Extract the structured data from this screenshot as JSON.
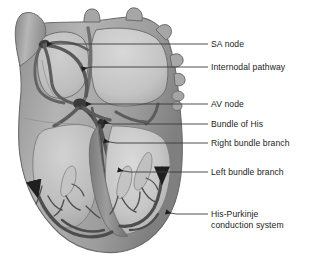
{
  "figure": {
    "background_color": "#ffffff",
    "text_color": "#1c1c1c",
    "leader_line_color": "#3a3a3a"
  },
  "palette": {
    "myocardium_light": "#b9b9b9",
    "myocardium_mid": "#9a9a9a",
    "myocardium_dark": "#7d7d7d",
    "chamber_light": "#c9c9c9",
    "chamber_lighter": "#d4d4d4",
    "conduction_dark": "#4a4a4a",
    "conduction_darker": "#333333",
    "outline": "#5e5e5e"
  },
  "labels": [
    {
      "id": "sa-node",
      "text": "SA node",
      "line_y": 44,
      "line_x_start": 178,
      "line_x_end": 208,
      "text_x": 211,
      "text_y": 39
    },
    {
      "id": "internodal-pathway",
      "text": "Internodal pathway",
      "line_y": 67,
      "line_x_start": 178,
      "line_x_end": 208,
      "text_x": 211,
      "text_y": 62
    },
    {
      "id": "av-node",
      "text": "AV node",
      "line_y": 104,
      "line_x_start": 178,
      "line_x_end": 208,
      "text_x": 211,
      "text_y": 99
    },
    {
      "id": "bundle-of-his",
      "text": "Bundle of His",
      "line_y": 124,
      "line_x_start": 178,
      "line_x_end": 208,
      "text_x": 211,
      "text_y": 119
    },
    {
      "id": "right-bundle-branch",
      "text": "Right bundle branch",
      "line_y": 143,
      "line_x_start": 178,
      "line_x_end": 208,
      "text_x": 211,
      "text_y": 138
    },
    {
      "id": "left-bundle-branch",
      "text": "Left bundle branch",
      "line_y": 172,
      "line_x_start": 178,
      "line_x_end": 208,
      "text_x": 211,
      "text_y": 167
    },
    {
      "id": "his-purkinje-conduction-system",
      "text": "His-Purkinje",
      "text_line2": "conduction system",
      "line_y": 214,
      "line_x_start": 178,
      "line_x_end": 208,
      "text_x": 211,
      "text_y": 209
    }
  ],
  "anatomy": {
    "structures": [
      "superior vena cava",
      "aorta",
      "pulmonary artery",
      "pulmonary veins",
      "right atrium",
      "left atrium",
      "right ventricle",
      "left ventricle",
      "interventricular septum",
      "atrioventricular valves",
      "papillary muscles",
      "purkinje fibers"
    ]
  }
}
